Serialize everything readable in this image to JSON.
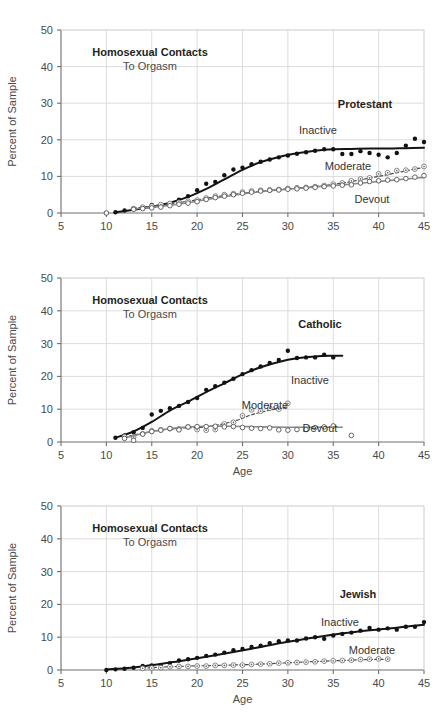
{
  "figure": {
    "width": 447,
    "height": 718,
    "background": "#ffffff",
    "panel_count": 3
  },
  "axis_common": {
    "ylabel": "Percent of Sample",
    "xlabel": "Age",
    "xticks": [
      5,
      10,
      15,
      20,
      25,
      30,
      35,
      40,
      45
    ],
    "yticks": [
      0,
      10,
      20,
      30,
      40,
      50
    ],
    "xlim": [
      5,
      45
    ],
    "ylim": [
      0,
      50
    ],
    "grid": true,
    "grid_color": "#dcdcdc"
  },
  "panels": [
    {
      "id": "protestant",
      "title_bold": "Homosexual Contacts",
      "title_sub": "To Orgasm",
      "group_label": "Protestant",
      "show_xlabel": false,
      "series_labels": {
        "inactive": "Inactive",
        "moderate": "Moderate",
        "devout": "Devout"
      }
    },
    {
      "id": "catholic",
      "title_bold": "Homosexual Contacts",
      "title_sub": "To Orgasm",
      "group_label": "Catholic",
      "show_xlabel": true,
      "series_labels": {
        "inactive": "Inactive",
        "moderate": "Moderate",
        "devout": "Devout"
      }
    },
    {
      "id": "jewish",
      "title_bold": "Homosexual Contacts",
      "title_sub": "To Orgasm",
      "group_label": "Jewish",
      "show_xlabel": true,
      "series_labels": {
        "inactive": "Inactive",
        "moderate": "Moderate"
      }
    }
  ],
  "chart_data": [
    {
      "type": "scatter",
      "id": "protestant",
      "title": "Homosexual Contacts To Orgasm — Protestant",
      "xlabel": "",
      "ylabel": "Percent of Sample",
      "xlim": [
        5,
        45
      ],
      "ylim": [
        0,
        50
      ],
      "grid": true,
      "legend_position": "inline-annotations",
      "series": [
        {
          "name": "Inactive",
          "marker": "filled-circle",
          "line": "solid-heavy",
          "x": [
            10,
            11,
            12,
            13,
            14,
            15,
            16,
            17,
            18,
            19,
            20,
            21,
            22,
            23,
            24,
            25,
            26,
            27,
            28,
            29,
            30,
            31,
            32,
            33,
            34,
            35,
            36,
            37,
            38,
            39,
            40,
            41,
            42,
            43,
            44,
            45
          ],
          "y": [
            0.0,
            0.2,
            0.7,
            1.1,
            1.4,
            2.2,
            2.0,
            2.6,
            3.6,
            4.6,
            6.2,
            8.0,
            8.5,
            10.3,
            11.9,
            12.4,
            13.3,
            14.0,
            14.6,
            15.2,
            15.7,
            16.2,
            16.6,
            17.0,
            17.4,
            17.4,
            16.1,
            16.1,
            16.9,
            16.4,
            15.9,
            15.2,
            16.4,
            18.4,
            20.3,
            19.4
          ],
          "fit_x": [
            11,
            13,
            15,
            17,
            19,
            21,
            23,
            25,
            27,
            29,
            31,
            33,
            35,
            37,
            39,
            41,
            43,
            45
          ],
          "fit_y": [
            0.2,
            0.9,
            1.7,
            2.8,
            4.4,
            6.6,
            9.2,
            11.8,
            13.9,
            15.3,
            16.3,
            17.0,
            17.4,
            17.5,
            17.6,
            17.6,
            17.7,
            17.8
          ]
        },
        {
          "name": "Moderate",
          "marker": "dotted-circle",
          "line": "dashed",
          "x": [
            13,
            14,
            15,
            16,
            17,
            18,
            19,
            20,
            21,
            22,
            23,
            24,
            25,
            26,
            27,
            28,
            29,
            30,
            31,
            32,
            33,
            34,
            35,
            36,
            37,
            38,
            39,
            40,
            41,
            42,
            43,
            44,
            45
          ],
          "y": [
            1.2,
            1.6,
            1.9,
            2.3,
            2.6,
            2.9,
            3.2,
            3.5,
            4.1,
            4.6,
            5.0,
            5.3,
            5.7,
            6.0,
            6.2,
            6.3,
            6.4,
            6.7,
            6.9,
            7.0,
            7.2,
            7.5,
            7.9,
            8.2,
            8.8,
            9.3,
            9.6,
            10.7,
            11.0,
            11.6,
            11.7,
            12.0,
            12.7
          ],
          "fit_x": [
            13,
            16,
            19,
            22,
            25,
            28,
            31,
            34,
            37,
            40,
            43,
            45
          ],
          "fit_y": [
            1.3,
            2.2,
            3.2,
            4.4,
            5.4,
            6.2,
            6.8,
            7.5,
            8.6,
            10.0,
            11.5,
            12.5
          ]
        },
        {
          "name": "Devout",
          "marker": "open-circle",
          "line": "solid-light",
          "x": [
            10,
            13,
            14,
            15,
            16,
            17,
            18,
            19,
            20,
            21,
            22,
            23,
            24,
            25,
            26,
            27,
            28,
            29,
            30,
            31,
            32,
            33,
            34,
            35,
            36,
            37,
            38,
            39,
            40,
            41,
            42,
            43,
            44,
            45
          ],
          "y": [
            0.0,
            1.0,
            1.2,
            1.4,
            1.6,
            2.0,
            2.4,
            2.7,
            3.1,
            3.7,
            4.2,
            4.6,
            5.0,
            5.4,
            5.7,
            6.0,
            6.2,
            6.3,
            6.5,
            6.6,
            6.8,
            7.0,
            7.2,
            7.4,
            7.6,
            7.7,
            8.2,
            8.6,
            8.8,
            9.0,
            9.1,
            9.4,
            9.8,
            10.2
          ],
          "fit_x": [
            13,
            16,
            19,
            22,
            25,
            28,
            31,
            34,
            37,
            40,
            43,
            45
          ],
          "fit_y": [
            1.1,
            1.8,
            2.8,
            4.1,
            5.2,
            6.1,
            6.7,
            7.3,
            7.9,
            8.6,
            9.3,
            9.7
          ]
        }
      ]
    },
    {
      "type": "scatter",
      "id": "catholic",
      "title": "Homosexual Contacts To Orgasm — Catholic",
      "xlabel": "Age",
      "ylabel": "Percent of Sample",
      "xlim": [
        5,
        45
      ],
      "ylim": [
        0,
        50
      ],
      "grid": true,
      "legend_position": "inline-annotations",
      "series": [
        {
          "name": "Inactive",
          "marker": "filled-circle",
          "line": "solid-heavy",
          "x": [
            11,
            12,
            13,
            14,
            15,
            16,
            17,
            18,
            19,
            20,
            21,
            22,
            23,
            24,
            25,
            26,
            27,
            28,
            29,
            30,
            31,
            32,
            33,
            34,
            35
          ],
          "y": [
            1.3,
            2.0,
            3.0,
            4.3,
            8.4,
            9.5,
            10.3,
            11.0,
            12.2,
            13.4,
            15.9,
            17.0,
            18.1,
            19.3,
            20.7,
            21.9,
            23.0,
            24.1,
            25.0,
            27.8,
            25.6,
            25.8,
            25.8,
            26.6,
            25.8
          ],
          "fit_x": [
            11,
            13,
            15,
            17,
            19,
            21,
            23,
            25,
            27,
            29,
            31,
            33,
            35,
            36
          ],
          "fit_y": [
            1.3,
            3.2,
            6.1,
            9.6,
            12.3,
            15.2,
            17.9,
            20.6,
            22.8,
            24.4,
            25.5,
            26.1,
            26.3,
            26.3
          ]
        },
        {
          "name": "Moderate",
          "marker": "dotted-circle",
          "line": "dashed",
          "x": [
            12,
            13,
            14,
            15,
            16,
            17,
            18,
            19,
            20,
            21,
            22,
            23,
            24,
            25,
            26,
            27,
            28,
            29,
            30
          ],
          "y": [
            1.6,
            1.5,
            2.5,
            3.4,
            3.7,
            4.1,
            4.0,
            4.6,
            3.8,
            3.6,
            3.8,
            5.5,
            6.0,
            8.0,
            9.8,
            9.4,
            10.3,
            10.0,
            11.8
          ],
          "fit_x": [
            12,
            15,
            18,
            21,
            24,
            26,
            28,
            30
          ],
          "fit_y": [
            1.5,
            3.2,
            4.2,
            4.6,
            6.3,
            8.3,
            9.7,
            10.7
          ]
        },
        {
          "name": "Devout",
          "marker": "open-circle",
          "line": "solid-light",
          "x": [
            12,
            13,
            14,
            15,
            16,
            17,
            18,
            19,
            20,
            21,
            22,
            23,
            24,
            25,
            26,
            27,
            28,
            29,
            30,
            31,
            32,
            33,
            34,
            35,
            37
          ],
          "y": [
            1.1,
            0.5,
            2.4,
            3.2,
            3.6,
            4.1,
            3.7,
            4.6,
            4.7,
            4.7,
            4.8,
            4.6,
            4.7,
            4.4,
            4.2,
            4.1,
            4.3,
            3.7,
            3.6,
            3.8,
            3.8,
            4.4,
            4.6,
            4.9,
            2.0
          ],
          "fit_x": [
            12,
            15,
            18,
            21,
            24,
            27,
            30,
            33,
            36
          ],
          "fit_y": [
            1.2,
            3.2,
            4.4,
            4.8,
            4.8,
            4.6,
            4.5,
            4.5,
            4.5
          ]
        }
      ]
    },
    {
      "type": "scatter",
      "id": "jewish",
      "title": "Homosexual Contacts To Orgasm — Jewish",
      "xlabel": "Age",
      "ylabel": "Percent of Sample",
      "xlim": [
        5,
        45
      ],
      "ylim": [
        0,
        50
      ],
      "grid": true,
      "legend_position": "inline-annotations",
      "series": [
        {
          "name": "Inactive",
          "marker": "filled-circle",
          "line": "solid-heavy",
          "x": [
            10,
            11,
            12,
            13,
            14,
            15,
            16,
            17,
            18,
            19,
            20,
            21,
            22,
            23,
            24,
            25,
            26,
            27,
            28,
            29,
            30,
            31,
            32,
            33,
            34,
            35,
            36,
            37,
            38,
            39,
            40,
            41,
            42,
            43,
            44,
            45
          ],
          "y": [
            0.0,
            0.2,
            0.4,
            0.7,
            1.2,
            1.4,
            1.5,
            2.1,
            2.9,
            3.3,
            3.7,
            4.3,
            4.7,
            5.3,
            6.0,
            6.4,
            7.0,
            7.4,
            8.2,
            8.8,
            9.0,
            9.0,
            9.6,
            10.0,
            9.5,
            10.5,
            11.0,
            11.4,
            12.0,
            12.8,
            12.3,
            12.7,
            12.3,
            13.2,
            13.2,
            14.6
          ],
          "fit_x": [
            10,
            14,
            18,
            22,
            26,
            30,
            34,
            38,
            42,
            45
          ],
          "fit_y": [
            0.1,
            1.1,
            2.7,
            4.5,
            6.5,
            8.6,
            10.4,
            11.8,
            12.9,
            13.8
          ]
        },
        {
          "name": "Moderate",
          "marker": "dotted-circle",
          "line": "dashed",
          "x": [
            14,
            15,
            16,
            17,
            18,
            19,
            20,
            21,
            22,
            23,
            24,
            25,
            26,
            27,
            28,
            29,
            30,
            31,
            32,
            33,
            34,
            35,
            36,
            37,
            38,
            39,
            40,
            41
          ],
          "y": [
            0.5,
            0.6,
            0.7,
            1.0,
            1.1,
            1.1,
            1.2,
            1.2,
            1.4,
            1.4,
            1.5,
            1.5,
            1.7,
            1.8,
            1.9,
            2.1,
            2.2,
            2.3,
            2.4,
            2.5,
            2.7,
            2.8,
            2.9,
            3.0,
            3.2,
            3.3,
            3.4,
            3.3
          ],
          "fit_x": [
            14,
            18,
            22,
            26,
            30,
            34,
            38,
            41
          ],
          "fit_y": [
            0.6,
            1.1,
            1.4,
            1.7,
            2.2,
            2.7,
            3.1,
            3.3
          ]
        }
      ]
    }
  ]
}
